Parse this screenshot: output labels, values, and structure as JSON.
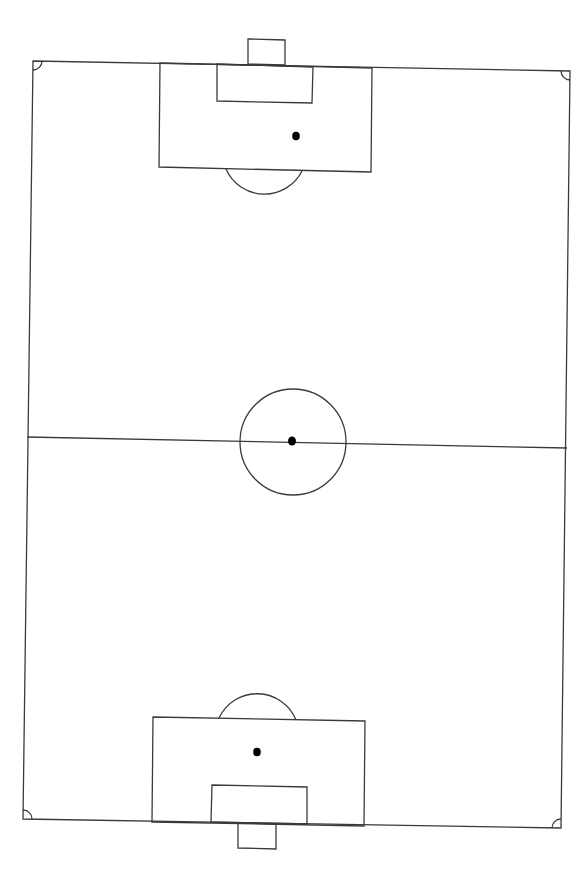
{
  "diagram": {
    "title": "Soccer pitch layout",
    "type": "football-field-line-drawing",
    "orientation": "vertical",
    "colors": {
      "background": "#ffffff",
      "lines": "#3a3a3a",
      "spots": "#000000"
    },
    "elements": [
      "outer boundary",
      "halfway line",
      "centre circle",
      "centre spot",
      "top goal",
      "top goal area",
      "top penalty area",
      "top penalty spot",
      "top penalty arc",
      "bottom goal",
      "bottom goal area",
      "bottom penalty area",
      "bottom penalty spot",
      "bottom penalty arc",
      "four corner arcs"
    ]
  }
}
